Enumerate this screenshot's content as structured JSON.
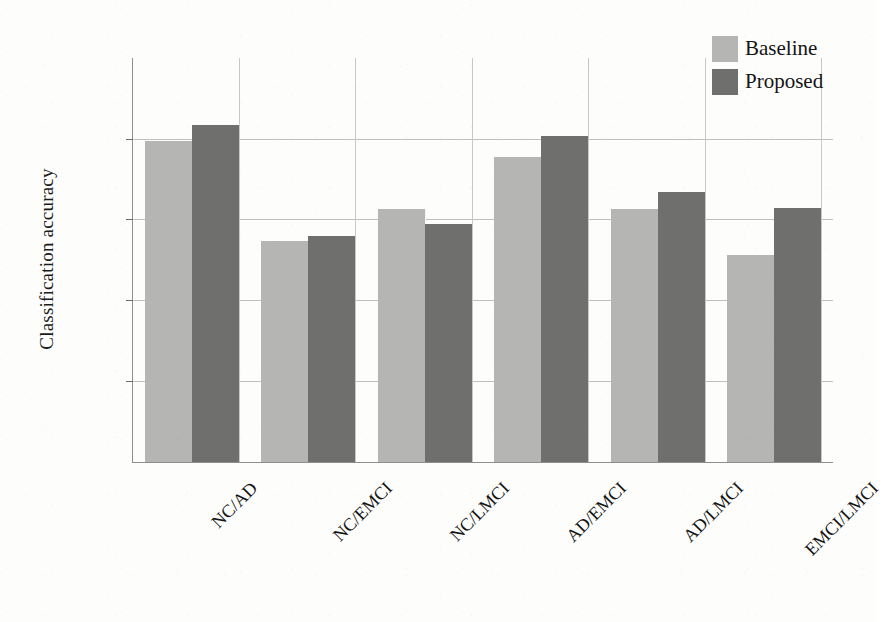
{
  "figure": {
    "background_color": "#fdfdfc",
    "baseline_color": "#b5b5b3",
    "proposed_color": "#6f6f6d",
    "axis_color": "#8e8e8e",
    "grid_color": "#c0c0c0"
  },
  "legend": {
    "position": "top-right",
    "entries": [
      {
        "label": "Baseline",
        "color": "#b5b5b3"
      },
      {
        "label": "Proposed",
        "color": "#6f6f6d"
      }
    ]
  },
  "chart_data": {
    "type": "bar",
    "title": "",
    "xlabel": "",
    "ylabel": "Classification accuracy",
    "ylim": [
      0,
      100
    ],
    "yticks": [
      0,
      20,
      40,
      60,
      80,
      100
    ],
    "ytick_labels": [
      "0",
      "20",
      "40",
      "60",
      "80",
      "100"
    ],
    "grid": true,
    "grid_axis": "both",
    "legend_position": "upper right",
    "categories": [
      "NC/AD",
      "NC/EMCI",
      "NC/LMCI",
      "AD/EMCI",
      "AD/LMCI",
      "EMCI/LMCI"
    ],
    "series": [
      {
        "name": "Baseline",
        "color": "#b5b5b3",
        "values": [
          79.5,
          54.7,
          62.6,
          75.5,
          62.6,
          51.3
        ]
      },
      {
        "name": "Proposed",
        "color": "#6f6f6d",
        "values": [
          83.4,
          55.9,
          58.9,
          80.7,
          66.9,
          62.9
        ]
      }
    ]
  }
}
